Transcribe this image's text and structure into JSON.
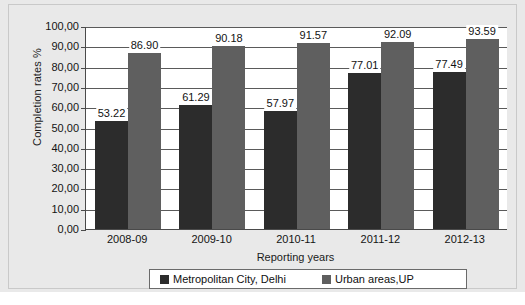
{
  "chart_data": {
    "type": "bar",
    "title": "",
    "subtitle": "",
    "xlabel": "Reporting years",
    "ylabel": "Completion rates %",
    "categories": [
      "2008-09",
      "2009-10",
      "2010-11",
      "2011-12",
      "2012-13"
    ],
    "series": [
      {
        "name": "Metropolitan City, Delhi",
        "color": "#2c2c2c",
        "values": [
          53.22,
          61.29,
          57.97,
          77.01,
          77.49
        ],
        "labels": [
          "53.22",
          "61.29",
          "57.97",
          "77.01",
          "77.49"
        ]
      },
      {
        "name": "Urban areas,UP",
        "color": "#5f5f5f",
        "values": [
          86.9,
          90.18,
          91.57,
          92.09,
          93.59
        ],
        "labels": [
          "86.90",
          "90.18",
          "91.57",
          "92.09",
          "93.59"
        ]
      }
    ],
    "ylim": [
      0,
      100
    ],
    "ytick_values": [
      0,
      10,
      20,
      30,
      40,
      50,
      60,
      70,
      80,
      90,
      100
    ],
    "ytick_labels": [
      "0,00",
      "10,00",
      "20,00",
      "30,00",
      "40,00",
      "50,00",
      "60,00",
      "70,00",
      "80,00",
      "90,00",
      "100,00"
    ],
    "grid": "horizontal",
    "legend_position": "bottom",
    "data_labels": true
  },
  "colors": {
    "background": "#e9e9e9",
    "plot_background": "#ffffff",
    "axis": "#4a4a4a",
    "gridline": "#5a5a5a",
    "text": "#141414"
  }
}
